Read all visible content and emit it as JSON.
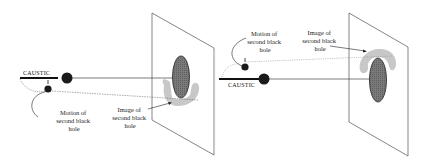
{
  "panels": [
    {
      "id": "left",
      "caustic_label": "CAUSTIC",
      "motion_label": [
        "Motion of",
        "second black",
        "hole"
      ],
      "image_label": [
        "Image of",
        "second black",
        "hole"
      ]
    },
    {
      "id": "right",
      "caustic_label": "CAUSTIC",
      "motion_label": [
        "Motion of",
        "second black",
        "hole"
      ],
      "image_label": [
        "Image of",
        "second black",
        "hole"
      ]
    }
  ],
  "colors": {
    "line": "#222222",
    "black_hole": "#1a1a1a",
    "image_fill": "#6f6f6f",
    "halo": "#c8c8c8"
  }
}
